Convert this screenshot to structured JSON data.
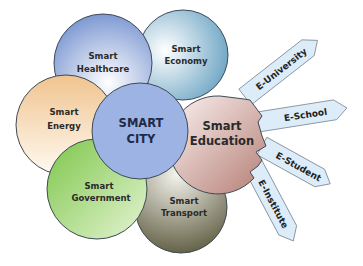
{
  "diagram": {
    "center": {
      "line1": "SMART",
      "line2": "CITY",
      "color": "#9db3e3"
    },
    "nodes": [
      {
        "id": "healthcare",
        "line1": "Smart",
        "line2": "Healthcare",
        "color": "#8ea6d8"
      },
      {
        "id": "economy",
        "line1": "Smart",
        "line2": "Economy",
        "color": "#7fb0cc"
      },
      {
        "id": "energy",
        "line1": "Smart",
        "line2": "Energy",
        "color": "#f2c99a"
      },
      {
        "id": "education",
        "line1": "Smart",
        "line2": "Education",
        "color": "#c99a92"
      },
      {
        "id": "government",
        "line1": "Smart",
        "line2": "Government",
        "color": "#8ccf5f"
      },
      {
        "id": "transport",
        "line1": "Smart",
        "line2": "Transport",
        "color": "#7e7c62"
      }
    ],
    "education_branches": [
      {
        "label": "E-University"
      },
      {
        "label": "E-School"
      },
      {
        "label": "E-Student"
      },
      {
        "label": "E-Institute"
      }
    ],
    "arrow_color": "#dcecf8"
  }
}
